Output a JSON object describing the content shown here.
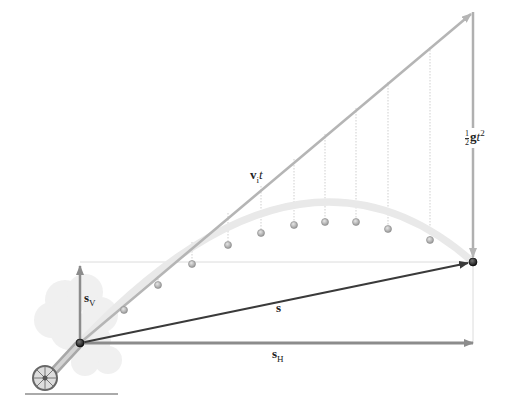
{
  "diagram": {
    "labels": {
      "vit": {
        "main": "v",
        "sub": "i",
        "tail": "t"
      },
      "half_g_t2": {
        "num": "1",
        "den": "2",
        "main": "g",
        "tail": "t",
        "sup": "2"
      },
      "s": {
        "main": "s"
      },
      "sV": {
        "main": "s",
        "sub": "V"
      },
      "sH": {
        "main": "s",
        "sub": "H"
      }
    },
    "points": {
      "launch": [
        80,
        343
      ],
      "landing": [
        473,
        262
      ],
      "vit_top": [
        473,
        12
      ]
    },
    "trajectory_balls": [
      [
        124,
        310
      ],
      [
        158,
        285
      ],
      [
        192,
        264
      ],
      [
        228,
        245
      ],
      [
        261,
        233
      ],
      [
        294,
        225
      ],
      [
        325,
        222
      ],
      [
        356,
        222
      ],
      [
        388,
        229
      ],
      [
        430,
        240
      ]
    ],
    "colors": {
      "vit_line": "#b5b5b5",
      "gravity_arrow": "#b0b0b0",
      "displacement_s": "#3a3a3a",
      "component_arrows": "#8c8c8c",
      "trajectory_band": "#e8e8e8",
      "ball": "#b8b8b8",
      "smoke": "#ececec"
    }
  }
}
